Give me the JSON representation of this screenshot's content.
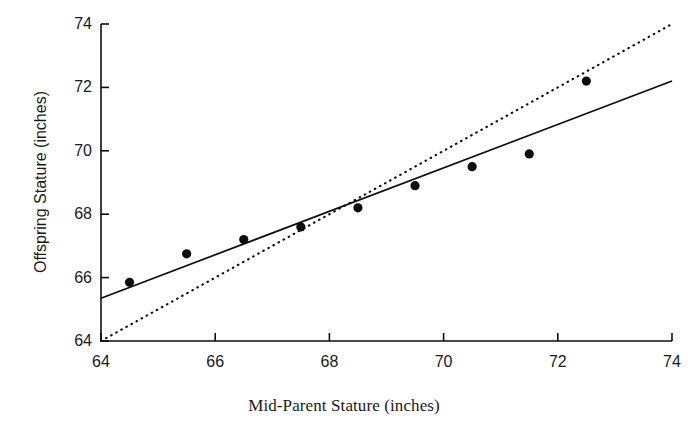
{
  "chart_data": {
    "type": "scatter",
    "title": "",
    "xlabel": "Mid-Parent Stature (inches)",
    "ylabel": "Offspring Stature (inches)",
    "xlim": [
      64,
      74
    ],
    "ylim": [
      64,
      74
    ],
    "xticks": [
      64,
      66,
      68,
      70,
      72,
      74
    ],
    "yticks": [
      64,
      66,
      68,
      70,
      72,
      74
    ],
    "xtick_labels": [
      "64",
      "66",
      "68",
      "70",
      "72",
      "74"
    ],
    "ytick_labels": [
      "64",
      "66",
      "68",
      "70",
      "72",
      "74"
    ],
    "grid": false,
    "legend": "none",
    "points": [
      {
        "x": 64.5,
        "y": 65.85
      },
      {
        "x": 65.5,
        "y": 66.75
      },
      {
        "x": 66.5,
        "y": 67.2
      },
      {
        "x": 67.5,
        "y": 67.6
      },
      {
        "x": 68.5,
        "y": 68.2
      },
      {
        "x": 69.5,
        "y": 68.9
      },
      {
        "x": 70.5,
        "y": 69.5
      },
      {
        "x": 71.5,
        "y": 69.9
      },
      {
        "x": 72.5,
        "y": 72.2
      }
    ],
    "marker": {
      "shape": "circle",
      "size": 8,
      "color": "#0d0d0d"
    },
    "series": [
      {
        "name": "regression-line",
        "style": "solid",
        "color": "#0d0d0d",
        "x": [
          64,
          74
        ],
        "y": [
          65.35,
          72.2
        ],
        "slope": 0.685,
        "intercept": 21.51
      },
      {
        "name": "identity-line",
        "style": "dotted",
        "color": "#0d0d0d",
        "x": [
          64,
          74
        ],
        "y": [
          64,
          74
        ],
        "slope": 1,
        "intercept": 0
      }
    ]
  },
  "axes": {
    "x_title": "Mid-Parent Stature (inches)",
    "y_title": "Offspring Stature (inches)"
  },
  "ticks": {
    "x": [
      "64",
      "66",
      "68",
      "70",
      "72",
      "74"
    ],
    "y": [
      "64",
      "66",
      "68",
      "70",
      "72",
      "74"
    ]
  },
  "colors": {
    "ink": "#0d0d0d",
    "background": "#ffffff"
  }
}
